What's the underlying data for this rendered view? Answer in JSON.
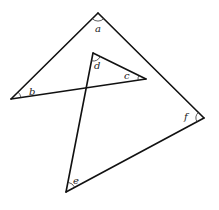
{
  "diagram": {
    "type": "geometry-angles",
    "colors": {
      "line": "#111111",
      "arc": "#333333",
      "label": "#222222",
      "background": "#ffffff"
    },
    "vertices": [
      {
        "id": "a",
        "x": 98,
        "y": 13
      },
      {
        "id": "b",
        "x": 11,
        "y": 99
      },
      {
        "id": "c",
        "x": 146,
        "y": 79
      },
      {
        "id": "d",
        "x": 93,
        "y": 53
      },
      {
        "id": "e",
        "x": 66,
        "y": 192
      },
      {
        "id": "f",
        "x": 204,
        "y": 118
      }
    ],
    "segments": [
      [
        "a",
        "b"
      ],
      [
        "a",
        "f"
      ],
      [
        "b",
        "c"
      ],
      [
        "c",
        "d"
      ],
      [
        "d",
        "e"
      ],
      [
        "e",
        "f"
      ]
    ],
    "angle_labels": {
      "a": "a",
      "b": "b",
      "c": "c",
      "d": "d",
      "e": "e",
      "f": "f"
    }
  }
}
